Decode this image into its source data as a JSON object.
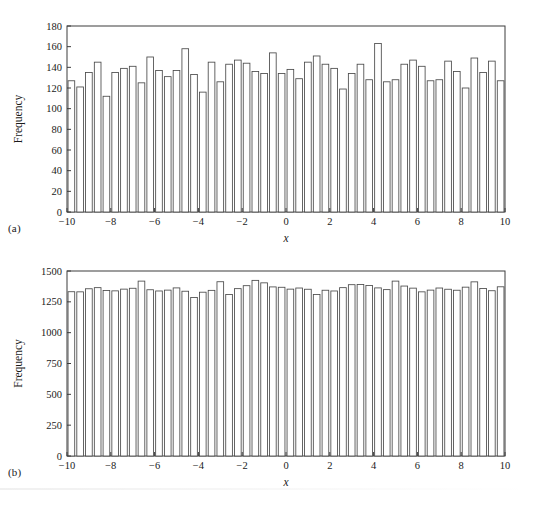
{
  "figure": {
    "caption_a": "(a)",
    "caption_b": "(b)"
  },
  "chart_data": [
    {
      "id": "a",
      "type": "bar",
      "title": "",
      "subtitle": "",
      "panel_label": "(a)",
      "xlabel": "x",
      "ylabel": "Frequency",
      "xlim": [
        -10,
        10
      ],
      "ylim": [
        0,
        180
      ],
      "xticks": [
        -10,
        -8,
        -6,
        -4,
        -2,
        0,
        2,
        4,
        6,
        8,
        10
      ],
      "xticklabels": [
        "−10",
        "−8",
        "−6",
        "−4",
        "−2",
        "0",
        "2",
        "4",
        "6",
        "8",
        "10"
      ],
      "yticks": [
        0,
        20,
        40,
        60,
        80,
        100,
        120,
        140,
        160,
        180
      ],
      "yticklabels": [
        "0",
        "20",
        "40",
        "60",
        "80",
        "100",
        "120",
        "140",
        "160",
        "180"
      ],
      "grid": false,
      "bin_count": 50,
      "bin_width": 0.4,
      "bin_edges_start": -10,
      "bar_fill": "#ffffff",
      "bar_edge": "#4a4a4a",
      "axis_color": "#3c3c3c",
      "values": [
        127,
        121,
        135,
        145,
        112,
        135,
        139,
        141,
        125,
        150,
        137,
        131,
        137,
        158,
        133,
        116,
        145,
        126,
        143,
        147,
        144,
        136,
        134,
        154,
        134,
        138,
        129,
        145,
        151,
        143,
        139,
        119,
        134,
        143,
        128,
        163,
        126,
        128,
        143,
        147,
        141,
        127,
        128,
        146,
        136,
        120,
        149,
        135,
        146,
        127
      ],
      "values_right": [
        134,
        144,
        138,
        128,
        133,
        140,
        137,
        132,
        136,
        137,
        138,
        143,
        133,
        141,
        142,
        130,
        127,
        136,
        140,
        137,
        149,
        139,
        140,
        131,
        137,
        142,
        143,
        128,
        136
      ]
    },
    {
      "id": "b",
      "type": "bar",
      "title": "",
      "subtitle": "",
      "panel_label": "(b)",
      "xlabel": "x",
      "ylabel": "Frequency",
      "xlim": [
        -10,
        10
      ],
      "ylim": [
        0,
        1500
      ],
      "xticks": [
        -10,
        -8,
        -6,
        -4,
        -2,
        0,
        2,
        4,
        6,
        8,
        10
      ],
      "xticklabels": [
        "−10",
        "−8",
        "−6",
        "−4",
        "−2",
        "0",
        "2",
        "4",
        "6",
        "8",
        "10"
      ],
      "yticks": [
        0,
        250,
        500,
        750,
        1000,
        1250,
        1500
      ],
      "yticklabels": [
        "0",
        "250",
        "500",
        "750",
        "1000",
        "1250",
        "1500"
      ],
      "grid": false,
      "bin_count": 50,
      "bin_width": 0.4,
      "bin_edges_start": -10,
      "bar_fill": "#ffffff",
      "bar_edge": "#4a4a4a",
      "axis_color": "#3c3c3c",
      "values": [
        1332,
        1331,
        1356,
        1365,
        1342,
        1339,
        1353,
        1360,
        1418,
        1348,
        1338,
        1345,
        1363,
        1336,
        1285,
        1328,
        1343,
        1413,
        1310,
        1357,
        1381,
        1424,
        1404,
        1371,
        1368,
        1353,
        1362,
        1352,
        1310,
        1344,
        1338,
        1365,
        1389,
        1391,
        1382,
        1363,
        1349,
        1418,
        1378,
        1361,
        1331,
        1345,
        1362,
        1352,
        1344,
        1369,
        1412,
        1358,
        1340,
        1372
      ],
      "values_right": [
        1370,
        1365,
        1340,
        1366,
        1402,
        1356,
        1355,
        1372,
        1380,
        1420,
        1365,
        1351,
        1336,
        1402,
        1346,
        1399,
        1342,
        1336,
        1340,
        1370,
        1381,
        1320
      ]
    }
  ]
}
